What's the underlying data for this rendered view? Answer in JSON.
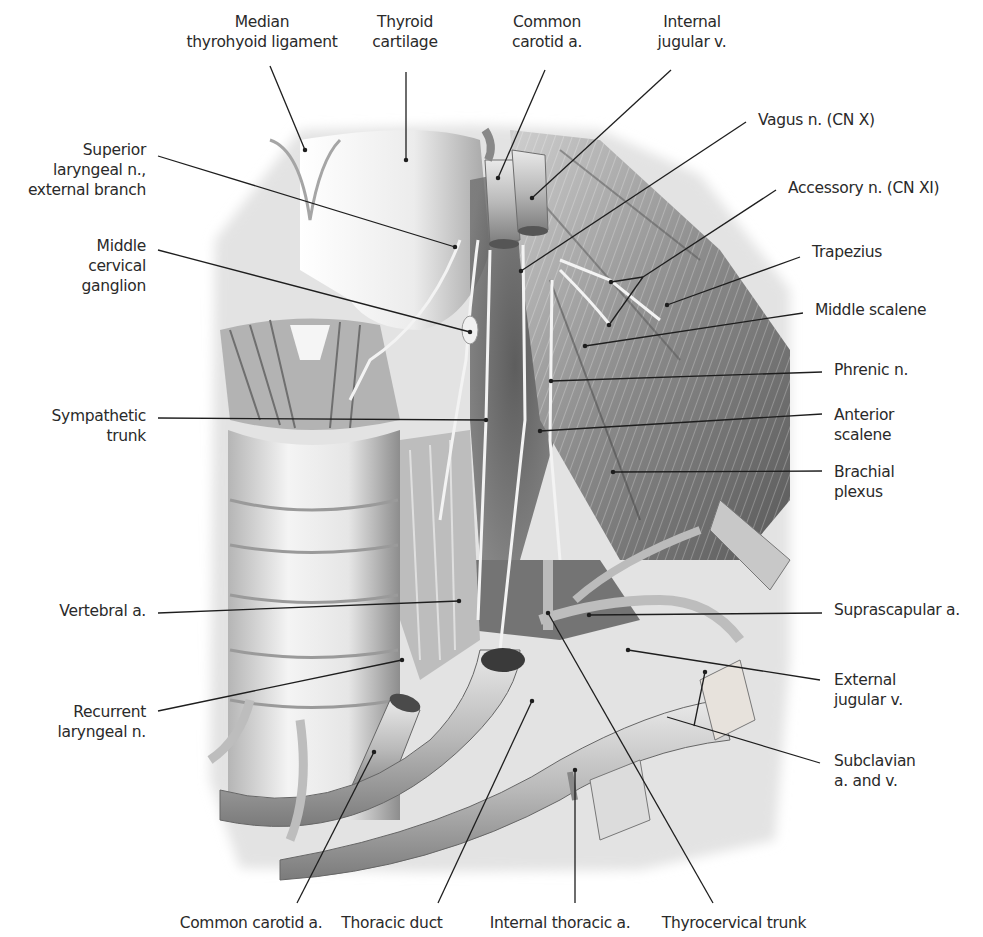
{
  "figure": {
    "colors": {
      "background": "#ffffff",
      "text": "#2a2a2a",
      "leader": "#1e1e1e"
    }
  },
  "labels": {
    "top": [
      {
        "id": "median-thyrohyoid-ligament",
        "lines": [
          "Median",
          "thyrohyoid ligament"
        ],
        "x": 262,
        "y": 12,
        "align": "center",
        "leader": [
          [
            270,
            66
          ],
          [
            305,
            150
          ]
        ]
      },
      {
        "id": "thyroid-cartilage",
        "lines": [
          "Thyroid",
          "cartilage"
        ],
        "x": 405,
        "y": 12,
        "align": "center",
        "leader": [
          [
            406,
            72
          ],
          [
            406,
            160
          ]
        ]
      },
      {
        "id": "common-carotid-a-top",
        "lines": [
          "Common",
          "carotid a."
        ],
        "x": 547,
        "y": 12,
        "align": "center",
        "leader": [
          [
            545,
            70
          ],
          [
            498,
            178
          ]
        ]
      },
      {
        "id": "internal-jugular-v",
        "lines": [
          "Internal",
          "jugular v."
        ],
        "x": 692,
        "y": 12,
        "align": "center",
        "leader": [
          [
            671,
            70
          ],
          [
            532,
            198
          ]
        ]
      }
    ],
    "left": [
      {
        "id": "superior-laryngeal-n-external-branch",
        "lines": [
          "Superior",
          "laryngeal n.,",
          "external branch"
        ],
        "x": 146,
        "y": 140,
        "align": "right",
        "leader": [
          [
            158,
            156
          ],
          [
            455,
            247
          ]
        ]
      },
      {
        "id": "middle-cervical-ganglion",
        "lines": [
          "Middle",
          "cervical",
          "ganglion"
        ],
        "x": 146,
        "y": 236,
        "align": "right",
        "leader": [
          [
            158,
            250
          ],
          [
            470,
            332
          ]
        ]
      },
      {
        "id": "sympathetic-trunk",
        "lines": [
          "Sympathetic",
          "trunk"
        ],
        "x": 146,
        "y": 406,
        "align": "right",
        "leader": [
          [
            158,
            418
          ],
          [
            486,
            420
          ]
        ]
      },
      {
        "id": "vertebral-a",
        "lines": [
          "Vertebral a."
        ],
        "x": 146,
        "y": 601,
        "align": "right",
        "leader": [
          [
            158,
            613
          ],
          [
            459,
            601
          ]
        ]
      },
      {
        "id": "recurrent-laryngeal-n",
        "lines": [
          "Recurrent",
          "laryngeal n."
        ],
        "x": 146,
        "y": 702,
        "align": "right",
        "leader": [
          [
            158,
            711
          ],
          [
            402,
            660
          ]
        ]
      }
    ],
    "right": [
      {
        "id": "vagus-n-cn-x",
        "lines": [
          "Vagus n. (CN X)"
        ],
        "x": 758,
        "y": 110,
        "align": "left",
        "leader": [
          [
            746,
            122
          ],
          [
            521,
            271
          ]
        ]
      },
      {
        "id": "accessory-n-cn-xi",
        "lines": [
          "Accessory n. (CN XI)"
        ],
        "x": 788,
        "y": 178,
        "align": "left",
        "leader": [
          [
            776,
            190
          ],
          [
            643,
            277
          ]
        ],
        "branches": [
          [
            [
              643,
              277
            ],
            [
              611,
              282
            ]
          ],
          [
            [
              643,
              277
            ],
            [
              609,
              325
            ]
          ]
        ]
      },
      {
        "id": "trapezius",
        "lines": [
          "Trapezius"
        ],
        "x": 812,
        "y": 242,
        "align": "left",
        "leader": [
          [
            800,
            257
          ],
          [
            667,
            305
          ]
        ]
      },
      {
        "id": "middle-scalene",
        "lines": [
          "Middle scalene"
        ],
        "x": 815,
        "y": 300,
        "align": "left",
        "leader": [
          [
            803,
            313
          ],
          [
            585,
            346
          ]
        ]
      },
      {
        "id": "phrenic-n",
        "lines": [
          "Phrenic n."
        ],
        "x": 834,
        "y": 360,
        "align": "left",
        "leader": [
          [
            822,
            372
          ],
          [
            551,
            381
          ]
        ]
      },
      {
        "id": "anterior-scalene",
        "lines": [
          "Anterior",
          "scalene"
        ],
        "x": 834,
        "y": 405,
        "align": "left",
        "leader": [
          [
            822,
            414
          ],
          [
            540,
            431
          ]
        ]
      },
      {
        "id": "brachial-plexus",
        "lines": [
          "Brachial",
          "plexus"
        ],
        "x": 834,
        "y": 462,
        "align": "left",
        "leader": [
          [
            822,
            471
          ],
          [
            613,
            472
          ]
        ]
      },
      {
        "id": "suprascapular-a",
        "lines": [
          "Suprascapular a."
        ],
        "x": 834,
        "y": 600,
        "align": "left",
        "leader": [
          [
            822,
            613
          ],
          [
            589,
            615
          ]
        ]
      },
      {
        "id": "external-jugular-v",
        "lines": [
          "External",
          "jugular v."
        ],
        "x": 834,
        "y": 670,
        "align": "left",
        "leader": [
          [
            820,
            680
          ],
          [
            628,
            650
          ]
        ]
      },
      {
        "id": "subclavian-a-and-v",
        "lines": [
          "Subclavian",
          "a. and v."
        ],
        "x": 834,
        "y": 751,
        "align": "left",
        "leader": [
          [
            820,
            763
          ],
          [
            667,
            717
          ]
        ],
        "branches": [
          [
            [
              694,
              726
            ],
            [
              705,
              672
            ]
          ]
        ]
      }
    ],
    "bottom": [
      {
        "id": "common-carotid-a-bottom",
        "lines": [
          "Common carotid a."
        ],
        "x": 251,
        "y": 913,
        "align": "center",
        "leader": [
          [
            297,
            903
          ],
          [
            374,
            752
          ]
        ]
      },
      {
        "id": "thoracic-duct",
        "lines": [
          "Thoracic duct"
        ],
        "x": 392,
        "y": 913,
        "align": "center",
        "leader": [
          [
            438,
            903
          ],
          [
            532,
            701
          ]
        ]
      },
      {
        "id": "internal-thoracic-a",
        "lines": [
          "Internal thoracic a."
        ],
        "x": 560,
        "y": 913,
        "align": "center",
        "leader": [
          [
            575,
            903
          ],
          [
            575,
            770
          ]
        ]
      },
      {
        "id": "thyrocervical-trunk",
        "lines": [
          "Thyrocervical trunk"
        ],
        "x": 734,
        "y": 913,
        "align": "center",
        "leader": [
          [
            713,
            903
          ],
          [
            548,
            613
          ]
        ]
      }
    ]
  }
}
